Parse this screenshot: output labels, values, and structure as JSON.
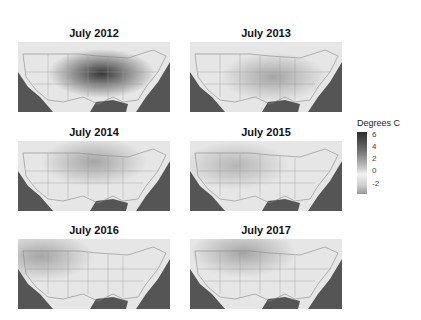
{
  "chart_data": {
    "type": "heatmap",
    "title": "",
    "panels": [
      {
        "title": "July 2012",
        "hotspot": {
          "cx": 0.55,
          "cy": 0.45,
          "intensity": 6
        }
      },
      {
        "title": "July 2013",
        "hotspot": {
          "cx": 0.55,
          "cy": 0.5,
          "intensity": 2
        }
      },
      {
        "title": "July 2014",
        "hotspot": {
          "cx": 0.5,
          "cy": 0.3,
          "intensity": 2
        }
      },
      {
        "title": "July 2015",
        "hotspot": {
          "cx": 0.3,
          "cy": 0.35,
          "intensity": 1.5
        }
      },
      {
        "title": "July 2016",
        "hotspot": {
          "cx": 0.15,
          "cy": 0.25,
          "intensity": 2
        }
      },
      {
        "title": "July 2017",
        "hotspot": {
          "cx": 0.35,
          "cy": 0.2,
          "intensity": 2
        }
      }
    ],
    "legend": {
      "title": "Degrees C",
      "ticks": [
        6,
        4,
        2,
        0,
        -2
      ],
      "range": [
        -3,
        6.5
      ]
    },
    "colormap": "grayscale (dark = warm anomaly)"
  }
}
